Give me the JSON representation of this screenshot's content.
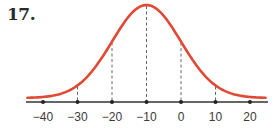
{
  "problem": {
    "number": "17."
  },
  "chart_data": {
    "type": "line",
    "title": "",
    "mean": -10,
    "std_dev": 10,
    "xlabel": "",
    "ylabel": "",
    "x_ticks": [
      -40,
      -30,
      -20,
      -10,
      0,
      10,
      20
    ],
    "x_tick_labels": [
      "−40",
      "−30",
      "−20",
      "−10",
      "0",
      "10",
      "20"
    ],
    "dashed_lines_at": [
      -30,
      -20,
      -10,
      0,
      10
    ],
    "xlim": [
      -45,
      25
    ],
    "grid": false,
    "colors": {
      "curve": "#e04a35",
      "axis": "#333333",
      "dashed": "#666666"
    }
  }
}
